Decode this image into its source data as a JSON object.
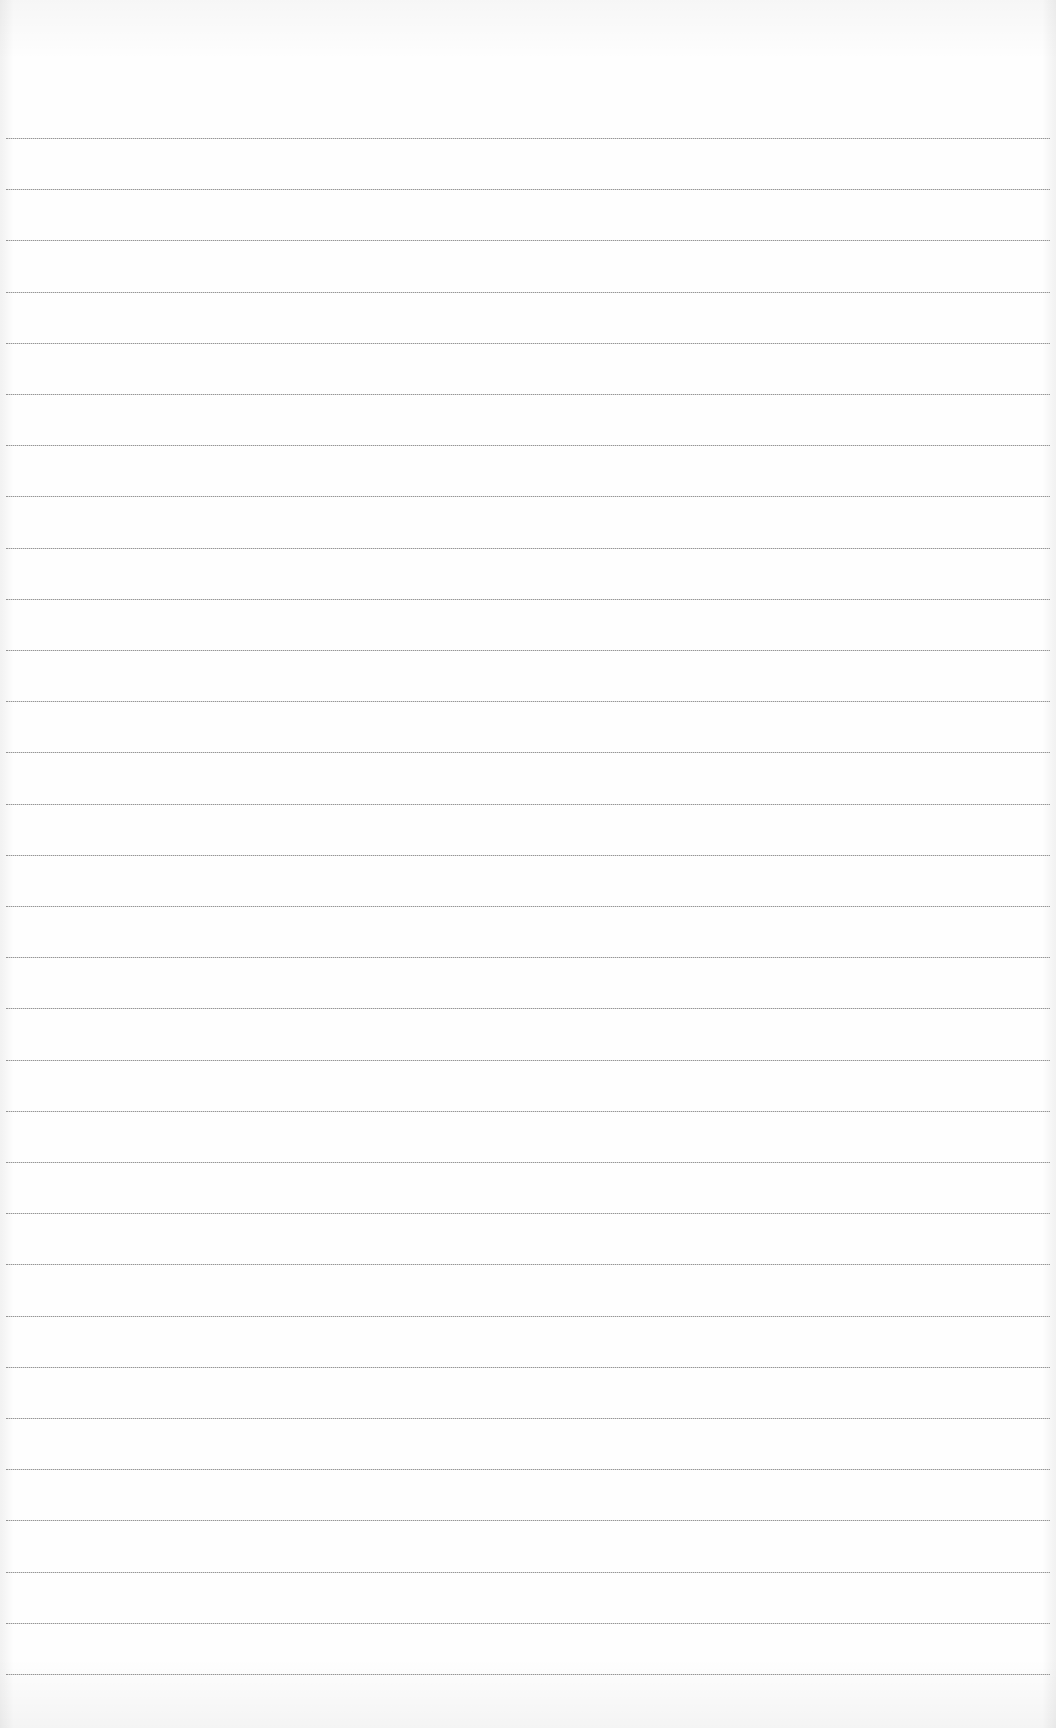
{
  "page": {
    "type": "blank ruled paper",
    "background_color": "#fefefe",
    "rule_color": "#8a8a8a",
    "rule_count": 31,
    "first_rule_y": 138,
    "rule_spacing_px": 51.2,
    "text_content": ""
  }
}
